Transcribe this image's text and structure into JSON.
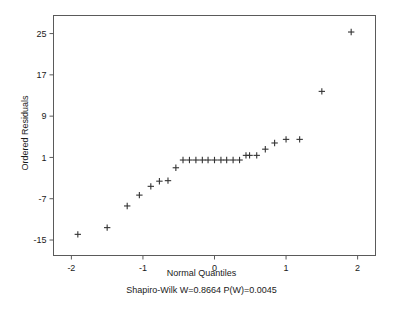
{
  "chart_data": {
    "type": "scatter",
    "title": "",
    "xlabel": "Normal Quantiles",
    "ylabel": "Ordered Residuals",
    "annotation": "Shapiro-Wilk W=0.8664 P(W)=0.0045",
    "marker": "plus",
    "marker_color": "#333333",
    "grid": false,
    "legend": null,
    "xlim": [
      -2.25,
      2.25
    ],
    "ylim": [
      -18.0,
      28.5
    ],
    "xticks": [
      -2,
      -1,
      0,
      1,
      2
    ],
    "xticklabels": [
      "-2",
      "-1",
      "0",
      "1",
      "2"
    ],
    "yticks": [
      -15,
      -7,
      1,
      9,
      17,
      25
    ],
    "yticklabels": [
      "-15",
      "-7",
      "1",
      "9",
      "17",
      "25"
    ],
    "x": [
      -1.91,
      -1.5,
      -1.22,
      -1.05,
      -0.89,
      -0.77,
      -0.65,
      -0.54,
      -0.44,
      -0.35,
      -0.26,
      -0.17,
      -0.09,
      0.0,
      0.09,
      0.17,
      0.26,
      0.35,
      0.44,
      0.49,
      0.59,
      0.71,
      0.84,
      1.0,
      1.19,
      1.5,
      1.91
    ],
    "y": [
      -13.9,
      -12.6,
      -8.4,
      -6.3,
      -4.6,
      -3.6,
      -3.5,
      -1.0,
      0.5,
      0.5,
      0.5,
      0.5,
      0.5,
      0.5,
      0.5,
      0.5,
      0.5,
      0.5,
      1.4,
      1.4,
      1.4,
      2.6,
      3.8,
      4.5,
      4.5,
      13.8,
      25.3
    ],
    "n_points": 27
  },
  "axes": {
    "frame_color": "#5a5a5a",
    "tick_color": "#5a5a5a"
  }
}
